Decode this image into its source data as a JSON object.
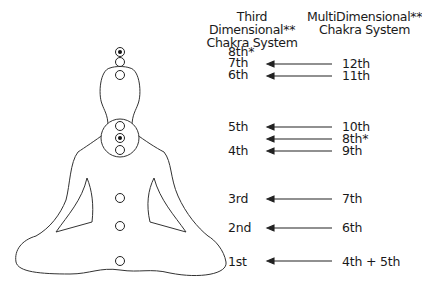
{
  "headers": {
    "left": {
      "line1": "Third Dimensional**",
      "line2": "Chakra System"
    },
    "right": {
      "line1": "MultiDimensional**",
      "line2": "Chakra System"
    }
  },
  "chakras": [
    {
      "id": "8th-top",
      "left_label": "8th*",
      "right_label": "",
      "arrow": false,
      "y": 52,
      "dotted": true
    },
    {
      "id": "7th",
      "left_label": "7th",
      "right_label": "12th",
      "arrow": true,
      "y": 62,
      "dotted": false
    },
    {
      "id": "6th",
      "left_label": "6th",
      "right_label": "11th",
      "arrow": true,
      "y": 75,
      "dotted": false
    },
    {
      "id": "5th",
      "left_label": "5th",
      "right_label": "10th",
      "arrow": true,
      "y": 126,
      "dotted": false
    },
    {
      "id": "8th-mid",
      "left_label": "",
      "right_label": "8th*",
      "arrow": true,
      "y": 138,
      "dotted": true
    },
    {
      "id": "4th",
      "left_label": "4th",
      "right_label": "9th",
      "arrow": true,
      "y": 150,
      "dotted": false
    },
    {
      "id": "3rd",
      "left_label": "3rd",
      "right_label": "7th",
      "arrow": true,
      "y": 198,
      "dotted": false
    },
    {
      "id": "2nd",
      "left_label": "2nd",
      "right_label": "6th",
      "arrow": true,
      "y": 226,
      "dotted": false
    },
    {
      "id": "1st",
      "left_label": "1st",
      "right_label": "4th + 5th",
      "arrow": true,
      "y": 261,
      "dotted": false
    }
  ],
  "colors": {
    "line": "#1a1a1a",
    "background": "#ffffff"
  }
}
